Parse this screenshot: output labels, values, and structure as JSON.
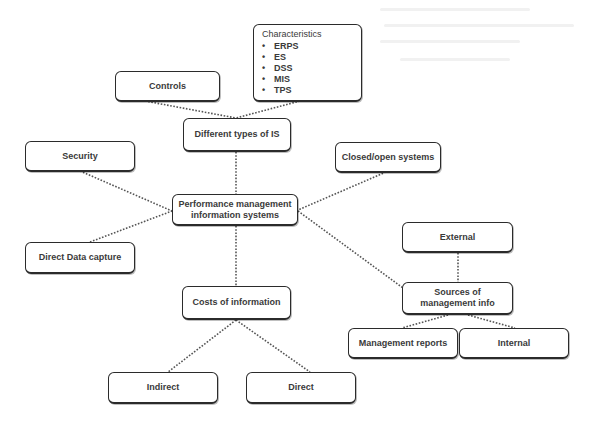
{
  "diagram": {
    "type": "mind-map",
    "style": {
      "background": "#ffffff",
      "box_border": "#2b2b2b",
      "text_color": "#3a3a3a",
      "connector_color": "#555555",
      "connector_style": "dotted"
    },
    "central_node": {
      "id": "pmis",
      "label": "Performance management information systems"
    },
    "nodes": {
      "characteristics": {
        "title": "Characteristics",
        "bullet": "•",
        "items": [
          "ERPS",
          "ES",
          "DSS",
          "MIS",
          "TPS"
        ]
      },
      "controls": {
        "label": "Controls"
      },
      "different_types": {
        "label": "Different types of IS"
      },
      "security": {
        "label": "Security"
      },
      "closed_open": {
        "label": "Closed/open systems"
      },
      "pmis": {
        "label": "Performance management information systems"
      },
      "direct_data_capture": {
        "label": "Direct Data capture"
      },
      "external": {
        "label": "External"
      },
      "costs": {
        "label": "Costs of information"
      },
      "sources": {
        "label": "Sources of management info"
      },
      "management_reports": {
        "label": "Management reports"
      },
      "internal": {
        "label": "Internal"
      },
      "indirect": {
        "label": "Indirect"
      },
      "direct": {
        "label": "Direct"
      }
    },
    "edges": [
      [
        "controls",
        "different_types"
      ],
      [
        "characteristics",
        "different_types"
      ],
      [
        "different_types",
        "pmis"
      ],
      [
        "security",
        "pmis"
      ],
      [
        "direct_data_capture",
        "pmis"
      ],
      [
        "closed_open",
        "pmis"
      ],
      [
        "pmis",
        "sources"
      ],
      [
        "pmis",
        "costs"
      ],
      [
        "costs",
        "indirect"
      ],
      [
        "costs",
        "direct"
      ],
      [
        "external",
        "sources"
      ],
      [
        "sources",
        "management_reports"
      ],
      [
        "sources",
        "internal"
      ]
    ]
  }
}
